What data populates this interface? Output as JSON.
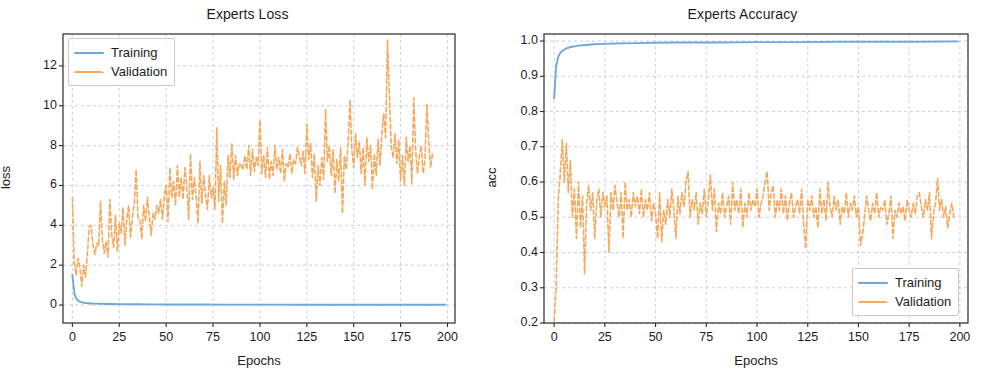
{
  "figure": {
    "width": 990,
    "height": 387,
    "background": "#ffffff"
  },
  "style": {
    "training_color": "#6fa8dc",
    "validation_color": "#f5a95c",
    "grid_color": "#b8c4d4",
    "axis_color": "#2a2a2a",
    "text_color": "#1c1c1c"
  },
  "panels": [
    {
      "id": "loss",
      "title": "Experts Loss",
      "xlabel": "Epochs",
      "ylabel": "loss",
      "xticks": [
        "0",
        "25",
        "50",
        "75",
        "100",
        "125",
        "150",
        "175",
        "200"
      ],
      "yticks": [
        "0",
        "2",
        "4",
        "6",
        "8",
        "10",
        "12"
      ],
      "legend": {
        "position": "upper left",
        "entries": [
          {
            "label": "Training",
            "style": "solid",
            "color": "#6fa8dc"
          },
          {
            "label": "Validation",
            "style": "dashed",
            "color": "#f5a95c"
          }
        ]
      }
    },
    {
      "id": "accuracy",
      "title": "Experts Accuracy",
      "xlabel": "Epochs",
      "ylabel": "acc",
      "xticks": [
        "0",
        "25",
        "50",
        "75",
        "100",
        "125",
        "150",
        "175",
        "200"
      ],
      "yticks": [
        "0.2",
        "0.3",
        "0.4",
        "0.5",
        "0.6",
        "0.7",
        "0.8",
        "0.9",
        "1.0"
      ],
      "legend": {
        "position": "lower right",
        "entries": [
          {
            "label": "Training",
            "style": "solid",
            "color": "#6fa8dc"
          },
          {
            "label": "Validation",
            "style": "dashed",
            "color": "#f5a95c"
          }
        ]
      }
    }
  ],
  "chart_data": [
    {
      "type": "line",
      "title": "Experts Loss",
      "xlabel": "Epochs",
      "ylabel": "loss",
      "xlim": [
        -5,
        204
      ],
      "ylim": [
        -0.9,
        13.6
      ],
      "xticks": [
        0,
        25,
        50,
        75,
        100,
        125,
        150,
        175,
        200
      ],
      "yticks": [
        0,
        2,
        4,
        6,
        8,
        10,
        12
      ],
      "grid": true,
      "legend": "upper left",
      "series": [
        {
          "name": "Training",
          "style": "solid",
          "color": "#6fa8dc",
          "x": [
            0,
            1,
            2,
            3,
            4,
            5,
            6,
            7,
            8,
            9,
            10,
            12,
            14,
            16,
            18,
            20,
            25,
            30,
            35,
            40,
            45,
            50,
            60,
            70,
            80,
            90,
            100,
            110,
            120,
            130,
            140,
            150,
            160,
            170,
            180,
            190,
            199
          ],
          "values": [
            1.52,
            0.62,
            0.33,
            0.22,
            0.17,
            0.14,
            0.12,
            0.105,
            0.095,
            0.088,
            0.082,
            0.072,
            0.065,
            0.06,
            0.056,
            0.053,
            0.046,
            0.041,
            0.038,
            0.035,
            0.033,
            0.031,
            0.028,
            0.026,
            0.024,
            0.023,
            0.021,
            0.02,
            0.019,
            0.018,
            0.017,
            0.016,
            0.016,
            0.015,
            0.015,
            0.014,
            0.014
          ]
        },
        {
          "name": "Validation",
          "style": "dashed",
          "color": "#f5a95c",
          "x": [
            0,
            1,
            2,
            3,
            4,
            5,
            6,
            7,
            8,
            9,
            10,
            11,
            12,
            13,
            14,
            15,
            16,
            17,
            18,
            19,
            20,
            21,
            22,
            23,
            24,
            25,
            26,
            27,
            28,
            29,
            30,
            31,
            32,
            33,
            34,
            35,
            36,
            37,
            38,
            39,
            40,
            41,
            42,
            43,
            44,
            45,
            46,
            47,
            48,
            49,
            50,
            51,
            52,
            53,
            54,
            55,
            56,
            57,
            58,
            59,
            60,
            61,
            62,
            63,
            64,
            65,
            66,
            67,
            68,
            69,
            70,
            71,
            72,
            73,
            74,
            75,
            76,
            77,
            78,
            79,
            80,
            81,
            82,
            83,
            84,
            85,
            86,
            87,
            88,
            89,
            90,
            91,
            92,
            93,
            94,
            95,
            96,
            97,
            98,
            99,
            100,
            101,
            102,
            103,
            104,
            105,
            106,
            107,
            108,
            109,
            110,
            111,
            112,
            113,
            114,
            115,
            116,
            117,
            118,
            119,
            120,
            121,
            122,
            123,
            124,
            125,
            126,
            127,
            128,
            129,
            130,
            131,
            132,
            133,
            134,
            135,
            136,
            137,
            138,
            139,
            140,
            141,
            142,
            143,
            144,
            145,
            146,
            147,
            148,
            149,
            150,
            151,
            152,
            153,
            154,
            155,
            156,
            157,
            158,
            159,
            160,
            161,
            162,
            163,
            164,
            165,
            166,
            167,
            168,
            169,
            170,
            171,
            172,
            173,
            174,
            175,
            176,
            177,
            178,
            179,
            180,
            181,
            182,
            183,
            184,
            185,
            186,
            187,
            188,
            189,
            190,
            191,
            192,
            193,
            194,
            195,
            196,
            197,
            198,
            199
          ],
          "values": [
            5.4,
            2.1,
            1.5,
            2.35,
            1.9,
            0.95,
            2.0,
            1.4,
            2.6,
            3.9,
            4.0,
            3.0,
            2.55,
            3.1,
            2.95,
            5.2,
            3.3,
            2.6,
            3.2,
            2.4,
            5.3,
            3.5,
            2.9,
            4.5,
            2.7,
            4.1,
            3.6,
            4.9,
            3.0,
            4.3,
            5.0,
            3.4,
            4.4,
            5.1,
            6.8,
            4.4,
            4.3,
            3.3,
            5.0,
            4.2,
            5.4,
            4.4,
            3.5,
            4.6,
            4.3,
            5.0,
            4.6,
            5.3,
            4.3,
            5.5,
            6.0,
            4.2,
            6.9,
            5.4,
            6.2,
            5.0,
            7.0,
            5.4,
            6.4,
            5.3,
            6.9,
            6.0,
            4.3,
            7.6,
            5.3,
            6.4,
            5.4,
            4.1,
            7.2,
            5.1,
            6.5,
            5.5,
            4.8,
            6.5,
            5.4,
            5.9,
            4.8,
            8.9,
            5.2,
            7.0,
            4.1,
            6.2,
            5.0,
            7.5,
            6.4,
            8.1,
            6.3,
            7.5,
            6.5,
            7.1,
            7.0,
            6.8,
            7.5,
            6.8,
            8.0,
            6.5,
            7.8,
            6.7,
            7.4,
            7.0,
            9.3,
            6.6,
            7.5,
            6.4,
            7.9,
            6.3,
            7.2,
            6.5,
            8.0,
            6.8,
            7.4,
            6.6,
            7.8,
            6.2,
            7.1,
            6.9,
            7.6,
            6.6,
            7.3,
            7.1,
            7.9,
            7.5,
            7.0,
            7.7,
            6.6,
            9.1,
            7.3,
            8.1,
            6.4,
            7.6,
            5.2,
            7.0,
            6.0,
            7.4,
            6.3,
            9.8,
            7.2,
            8.0,
            6.5,
            7.8,
            5.6,
            7.3,
            6.2,
            7.9,
            4.6,
            7.5,
            6.8,
            8.1,
            10.3,
            7.8,
            6.9,
            8.6,
            7.4,
            8.2,
            6.6,
            7.9,
            6.0,
            8.4,
            7.2,
            8.0,
            5.8,
            7.6,
            6.5,
            8.3,
            7.0,
            8.6,
            9.6,
            8.4,
            13.3,
            10.5,
            8.0,
            7.4,
            8.6,
            7.1,
            8.3,
            6.2,
            7.5,
            6.0,
            8.4,
            7.2,
            8.0,
            6.1,
            10.4,
            7.8,
            6.6,
            7.5,
            8.0,
            6.6,
            7.3,
            10.1,
            8.2,
            6.9,
            7.6
          ]
        }
      ]
    },
    {
      "type": "line",
      "title": "Experts Accuracy",
      "xlabel": "Epochs",
      "ylabel": "acc",
      "xlim": [
        -5,
        204
      ],
      "ylim": [
        0.2,
        1.02
      ],
      "xticks": [
        0,
        25,
        50,
        75,
        100,
        125,
        150,
        175,
        200
      ],
      "yticks": [
        0.2,
        0.3,
        0.4,
        0.5,
        0.6,
        0.7,
        0.8,
        0.9,
        1.0
      ],
      "grid": true,
      "legend": "lower right",
      "series": [
        {
          "name": "Training",
          "style": "solid",
          "color": "#6fa8dc",
          "x": [
            0,
            1,
            2,
            3,
            4,
            5,
            6,
            7,
            8,
            9,
            10,
            12,
            14,
            16,
            18,
            20,
            25,
            30,
            40,
            50,
            60,
            80,
            100,
            120,
            140,
            160,
            180,
            199
          ],
          "values": [
            0.838,
            0.93,
            0.955,
            0.966,
            0.972,
            0.976,
            0.979,
            0.981,
            0.983,
            0.984,
            0.985,
            0.987,
            0.988,
            0.989,
            0.99,
            0.991,
            0.992,
            0.993,
            0.994,
            0.995,
            0.996,
            0.996,
            0.997,
            0.997,
            0.998,
            0.998,
            0.998,
            0.999
          ]
        },
        {
          "name": "Validation",
          "style": "dashed",
          "color": "#f5a95c",
          "x": [
            0,
            1,
            2,
            3,
            4,
            5,
            6,
            7,
            8,
            9,
            10,
            11,
            12,
            13,
            14,
            15,
            16,
            17,
            18,
            19,
            20,
            21,
            22,
            23,
            24,
            25,
            26,
            27,
            28,
            29,
            30,
            31,
            32,
            33,
            34,
            35,
            36,
            37,
            38,
            39,
            40,
            41,
            42,
            43,
            44,
            45,
            46,
            47,
            48,
            49,
            50,
            51,
            52,
            53,
            54,
            55,
            56,
            57,
            58,
            59,
            60,
            61,
            62,
            63,
            64,
            65,
            66,
            67,
            68,
            69,
            70,
            71,
            72,
            73,
            74,
            75,
            76,
            77,
            78,
            79,
            80,
            81,
            82,
            83,
            84,
            85,
            86,
            87,
            88,
            89,
            90,
            91,
            92,
            93,
            94,
            95,
            96,
            97,
            98,
            99,
            100,
            101,
            102,
            103,
            104,
            105,
            106,
            107,
            108,
            109,
            110,
            111,
            112,
            113,
            114,
            115,
            116,
            117,
            118,
            119,
            120,
            121,
            122,
            123,
            124,
            125,
            126,
            127,
            128,
            129,
            130,
            131,
            132,
            133,
            134,
            135,
            136,
            137,
            138,
            139,
            140,
            141,
            142,
            143,
            144,
            145,
            146,
            147,
            148,
            149,
            150,
            151,
            152,
            153,
            154,
            155,
            156,
            157,
            158,
            159,
            160,
            161,
            162,
            163,
            164,
            165,
            166,
            167,
            168,
            169,
            170,
            171,
            172,
            173,
            174,
            175,
            176,
            177,
            178,
            179,
            180,
            181,
            182,
            183,
            184,
            185,
            186,
            187,
            188,
            189,
            190,
            191,
            192,
            193,
            194,
            195,
            196,
            197,
            198,
            199
          ],
          "values": [
            0.205,
            0.3,
            0.55,
            0.62,
            0.72,
            0.6,
            0.71,
            0.57,
            0.66,
            0.5,
            0.58,
            0.44,
            0.6,
            0.47,
            0.56,
            0.34,
            0.54,
            0.59,
            0.52,
            0.57,
            0.44,
            0.55,
            0.58,
            0.5,
            0.57,
            0.53,
            0.56,
            0.4,
            0.57,
            0.52,
            0.59,
            0.54,
            0.5,
            0.57,
            0.44,
            0.6,
            0.52,
            0.55,
            0.5,
            0.57,
            0.53,
            0.56,
            0.51,
            0.58,
            0.5,
            0.55,
            0.52,
            0.57,
            0.49,
            0.54,
            0.51,
            0.44,
            0.57,
            0.43,
            0.52,
            0.48,
            0.55,
            0.5,
            0.58,
            0.52,
            0.44,
            0.56,
            0.51,
            0.57,
            0.53,
            0.6,
            0.63,
            0.5,
            0.55,
            0.52,
            0.57,
            0.48,
            0.54,
            0.51,
            0.58,
            0.5,
            0.55,
            0.62,
            0.52,
            0.58,
            0.46,
            0.54,
            0.51,
            0.57,
            0.5,
            0.53,
            0.56,
            0.48,
            0.6,
            0.52,
            0.55,
            0.51,
            0.58,
            0.47,
            0.54,
            0.5,
            0.57,
            0.52,
            0.55,
            0.53,
            0.58,
            0.5,
            0.54,
            0.56,
            0.6,
            0.63,
            0.52,
            0.57,
            0.59,
            0.5,
            0.55,
            0.52,
            0.58,
            0.51,
            0.56,
            0.49,
            0.54,
            0.57,
            0.5,
            0.53,
            0.55,
            0.51,
            0.58,
            0.48,
            0.41,
            0.55,
            0.52,
            0.56,
            0.5,
            0.53,
            0.47,
            0.58,
            0.51,
            0.55,
            0.49,
            0.6,
            0.53,
            0.5,
            0.56,
            0.52,
            0.55,
            0.48,
            0.53,
            0.51,
            0.57,
            0.5,
            0.54,
            0.52,
            0.56,
            0.5,
            0.53,
            0.42,
            0.45,
            0.5,
            0.56,
            0.52,
            0.49,
            0.54,
            0.51,
            0.57,
            0.5,
            0.53,
            0.52,
            0.55,
            0.48,
            0.51,
            0.56,
            0.44,
            0.52,
            0.5,
            0.54,
            0.51,
            0.53,
            0.49,
            0.55,
            0.52,
            0.5,
            0.54,
            0.51,
            0.56,
            0.57,
            0.53,
            0.5,
            0.55,
            0.52,
            0.57,
            0.44,
            0.51,
            0.54,
            0.61,
            0.52,
            0.55,
            0.5,
            0.53,
            0.47,
            0.51,
            0.54,
            0.5
          ]
        }
      ]
    }
  ]
}
